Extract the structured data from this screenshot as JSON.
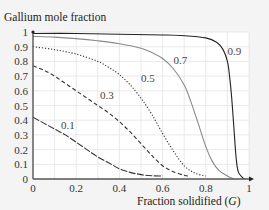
{
  "chart_data": {
    "type": "line",
    "title": "",
    "ylabel": "Gallium mole fraction",
    "xlabel": "Fraction solidified (G)",
    "xlabel_parts": {
      "text": "Fraction solidified (",
      "var": "G",
      "close": ")"
    },
    "xlim": [
      0,
      1
    ],
    "ylim": [
      0,
      1
    ],
    "grid": true,
    "legend": "inline curve labels",
    "x_ticks": [
      "0",
      "0.2",
      "0.4",
      "0.6",
      "0.8",
      "1"
    ],
    "y_ticks": [
      "0",
      "0.1",
      "0.2",
      "0.3",
      "0.4",
      "0.5",
      "0.6",
      "0.7",
      "0.8",
      "0.9",
      "1"
    ],
    "series": [
      {
        "name": "0.1",
        "style": "long-dash",
        "color": "#333333",
        "x": [
          0,
          0.05,
          0.1,
          0.15,
          0.2,
          0.25,
          0.3,
          0.35,
          0.4,
          0.45,
          0.5,
          0.55,
          0.6
        ],
        "y": [
          0.42,
          0.38,
          0.34,
          0.3,
          0.25,
          0.2,
          0.15,
          0.11,
          0.07,
          0.045,
          0.03,
          0.022,
          0.02
        ],
        "label_pos": [
          0.13,
          0.37
        ]
      },
      {
        "name": "0.3",
        "style": "dashed",
        "color": "#333333",
        "x": [
          0,
          0.05,
          0.1,
          0.15,
          0.2,
          0.25,
          0.3,
          0.35,
          0.4,
          0.45,
          0.5,
          0.55,
          0.6,
          0.65,
          0.7,
          0.72
        ],
        "y": [
          0.77,
          0.74,
          0.7,
          0.65,
          0.6,
          0.55,
          0.5,
          0.45,
          0.39,
          0.32,
          0.24,
          0.16,
          0.09,
          0.05,
          0.025,
          0.02
        ],
        "label_pos": [
          0.31,
          0.57
        ]
      },
      {
        "name": "0.5",
        "style": "dotted",
        "color": "#333333",
        "x": [
          0,
          0.1,
          0.2,
          0.3,
          0.35,
          0.4,
          0.45,
          0.5,
          0.55,
          0.6,
          0.65,
          0.7,
          0.75,
          0.8
        ],
        "y": [
          0.9,
          0.88,
          0.85,
          0.8,
          0.76,
          0.71,
          0.64,
          0.55,
          0.44,
          0.31,
          0.19,
          0.09,
          0.04,
          0.02
        ],
        "label_pos": [
          0.5,
          0.69
        ]
      },
      {
        "name": "0.7",
        "style": "solid",
        "color": "#8a8a8a",
        "x": [
          0,
          0.1,
          0.2,
          0.3,
          0.4,
          0.5,
          0.55,
          0.6,
          0.65,
          0.7,
          0.73,
          0.76,
          0.8,
          0.83,
          0.86,
          0.9,
          0.93
        ],
        "y": [
          0.97,
          0.965,
          0.955,
          0.94,
          0.92,
          0.89,
          0.86,
          0.82,
          0.75,
          0.64,
          0.53,
          0.4,
          0.22,
          0.12,
          0.06,
          0.02,
          0.0
        ],
        "label_pos": [
          0.65,
          0.81
        ]
      },
      {
        "name": "0.9",
        "style": "solid",
        "color": "#222222",
        "x": [
          0,
          0.2,
          0.4,
          0.6,
          0.7,
          0.8,
          0.85,
          0.88,
          0.9,
          0.91,
          0.92,
          0.93,
          0.94,
          0.95,
          0.97,
          0.98
        ],
        "y": [
          0.99,
          0.99,
          0.985,
          0.98,
          0.975,
          0.96,
          0.93,
          0.88,
          0.8,
          0.7,
          0.55,
          0.35,
          0.15,
          0.05,
          0.01,
          0.0
        ],
        "label_pos": [
          0.9,
          0.87
        ]
      }
    ]
  },
  "colors": {
    "background": "#f4f4f4",
    "plot_bg": "#ffffff",
    "grid": "#e4e4e4",
    "axis": "#555555"
  }
}
